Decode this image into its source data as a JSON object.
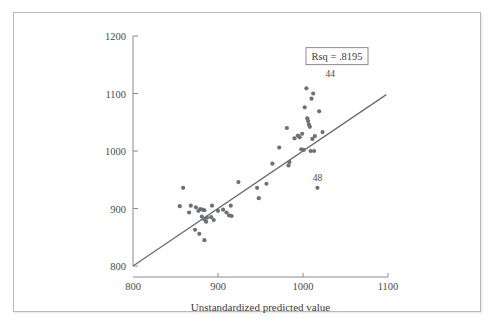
{
  "page": {
    "background_color": "#ffffff",
    "frame_color": "#b9b9b9"
  },
  "chart_data": {
    "type": "scatter",
    "title": "",
    "xlabel": "Unstandardized predicted value",
    "ylabel": "",
    "xlim": [
      800,
      1100
    ],
    "ylim": [
      800,
      1200
    ],
    "xticks": [
      800,
      900,
      1000,
      1100
    ],
    "yticks": [
      800,
      900,
      1000,
      1100,
      1200
    ],
    "grid": false,
    "legend": "none",
    "annotations": [
      {
        "name": "rsq",
        "text": "Rsq = .8195",
        "x": 1040,
        "y": 1165,
        "boxed": true
      }
    ],
    "point_labels": [
      {
        "text": "44",
        "x": 1032,
        "y": 1128
      },
      {
        "text": "48",
        "x": 1017,
        "y": 948
      }
    ],
    "fit_line": {
      "name": "regression-line",
      "x": [
        800,
        1098
      ],
      "y": [
        800,
        1098
      ],
      "color": "#6b6b73"
    },
    "point_color": "#6e7078",
    "points": [
      [
        859,
        936
      ],
      [
        855,
        904
      ],
      [
        868,
        905
      ],
      [
        866,
        893
      ],
      [
        874,
        902
      ],
      [
        877,
        896
      ],
      [
        879,
        899
      ],
      [
        882,
        898
      ],
      [
        884,
        897
      ],
      [
        881,
        886
      ],
      [
        884,
        881
      ],
      [
        887,
        884
      ],
      [
        886,
        877
      ],
      [
        873,
        863
      ],
      [
        878,
        856
      ],
      [
        884,
        845
      ],
      [
        893,
        905
      ],
      [
        892,
        885
      ],
      [
        895,
        880
      ],
      [
        900,
        896
      ],
      [
        906,
        898
      ],
      [
        910,
        893
      ],
      [
        915,
        905
      ],
      [
        913,
        888
      ],
      [
        916,
        887
      ],
      [
        924,
        946
      ],
      [
        946,
        936
      ],
      [
        948,
        918
      ],
      [
        957,
        943
      ],
      [
        964,
        978
      ],
      [
        972,
        1006
      ],
      [
        981,
        1040
      ],
      [
        984,
        981
      ],
      [
        983,
        975
      ],
      [
        990,
        1022
      ],
      [
        994,
        1027
      ],
      [
        996,
        1024
      ],
      [
        999,
        1030
      ],
      [
        998,
        1003
      ],
      [
        1001,
        1002
      ],
      [
        1017,
        936
      ],
      [
        1009,
        1000
      ],
      [
        1005,
        1057
      ],
      [
        1006,
        1052
      ],
      [
        1007,
        1046
      ],
      [
        1008,
        1042
      ],
      [
        1002,
        1076
      ],
      [
        1010,
        1091
      ],
      [
        1004,
        1109
      ],
      [
        1012,
        1100
      ],
      [
        1019,
        1069
      ],
      [
        1023,
        1033
      ],
      [
        1014,
        1026
      ],
      [
        1011,
        1021
      ],
      [
        1013,
        1000
      ]
    ]
  }
}
